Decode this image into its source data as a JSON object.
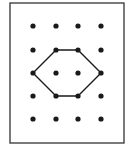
{
  "diagram": {
    "frame": {
      "x": 10,
      "y": 3,
      "width": 114,
      "height": 140,
      "stroke": "#333333"
    },
    "grid": {
      "columns_x": [
        33,
        56,
        78,
        101
      ],
      "rows_y": [
        26,
        50,
        73,
        96,
        119
      ],
      "dot_radius": 2.6,
      "dot_color": "#1a1a1a"
    },
    "hexagon": {
      "points": [
        [
          56,
          50
        ],
        [
          78,
          50
        ],
        [
          101,
          73
        ],
        [
          78,
          96
        ],
        [
          56,
          96
        ],
        [
          33,
          73
        ]
      ],
      "stroke": "#1a1a1a",
      "stroke_width": 1.4
    }
  }
}
